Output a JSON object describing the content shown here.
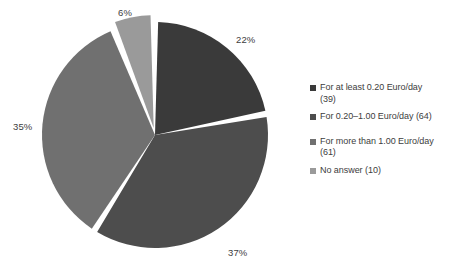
{
  "chart_data": {
    "type": "pie",
    "title": "",
    "xlabel": "",
    "ylabel": "",
    "legend_position": "right",
    "grid": false,
    "categories": [
      "For at least 0.20 Euro/day (39)",
      "For 0.20–1.00 Euro/day (64)",
      "For more than 1.00 Euro/day (61)",
      "No answer (10)"
    ],
    "values": [
      39,
      64,
      61,
      10
    ],
    "percentages": [
      22,
      37,
      35,
      6
    ],
    "total": 174,
    "slices": [
      {
        "label": "For at least 0.20 Euro/day (39)",
        "count": 39,
        "percent_label": "22%",
        "percent": 22,
        "color": "#3a3a3a",
        "start_angle": 0,
        "end_angle": 79.2,
        "exploded": false
      },
      {
        "label": "For 0.20–1.00 Euro/day (64)",
        "count": 64,
        "percent_label": "37%",
        "percent": 37,
        "color": "#4d4d4d",
        "start_angle": 79.2,
        "end_angle": 212.4,
        "exploded": false
      },
      {
        "label": "For more than 1.00 Euro/day (61)",
        "count": 61,
        "percent_label": "35%",
        "percent": 35,
        "color": "#707070",
        "start_angle": 212.4,
        "end_angle": 338.4,
        "exploded": false
      },
      {
        "label": "No answer (10)",
        "count": 10,
        "percent_label": "6%",
        "percent": 6,
        "color": "#9a9a9a",
        "start_angle": 338.4,
        "end_angle": 360,
        "exploded": true
      }
    ]
  },
  "labels": {
    "top": "6%",
    "right": "22%",
    "bottom": "37%",
    "left": "35%"
  },
  "legend": {
    "items": [
      {
        "label": "For at least 0.20 Euro/day",
        "line1": "For at least 0.20 Euro/day",
        "line2": "(39)",
        "full": "For at least 0.20 Euro/day (39)",
        "color": "#3a3a3a"
      },
      {
        "label": "For 0.20–1.00 Euro/day (64)",
        "line1": "For 0.20–1.00 Euro/day (64)",
        "line2": "",
        "full": "For 0.20–1.00 Euro/day (64)",
        "color": "#4d4d4d"
      },
      {
        "label": "For more than 1.00 Euro/day",
        "line1": "For more than 1.00 Euro/day",
        "line2": "(61)",
        "full": "For more than 1.00 Euro/day (61)",
        "color": "#707070"
      },
      {
        "label": "No answer (10)",
        "line1": "No answer (10)",
        "line2": "",
        "full": "No answer (10)",
        "color": "#9a9a9a"
      }
    ]
  },
  "colors": {
    "slice_1": "#3a3a3a",
    "slice_2": "#4d4d4d",
    "slice_3": "#707070",
    "slice_4": "#9a9a9a",
    "background": "#ffffff",
    "text": "#3d3d3d"
  }
}
